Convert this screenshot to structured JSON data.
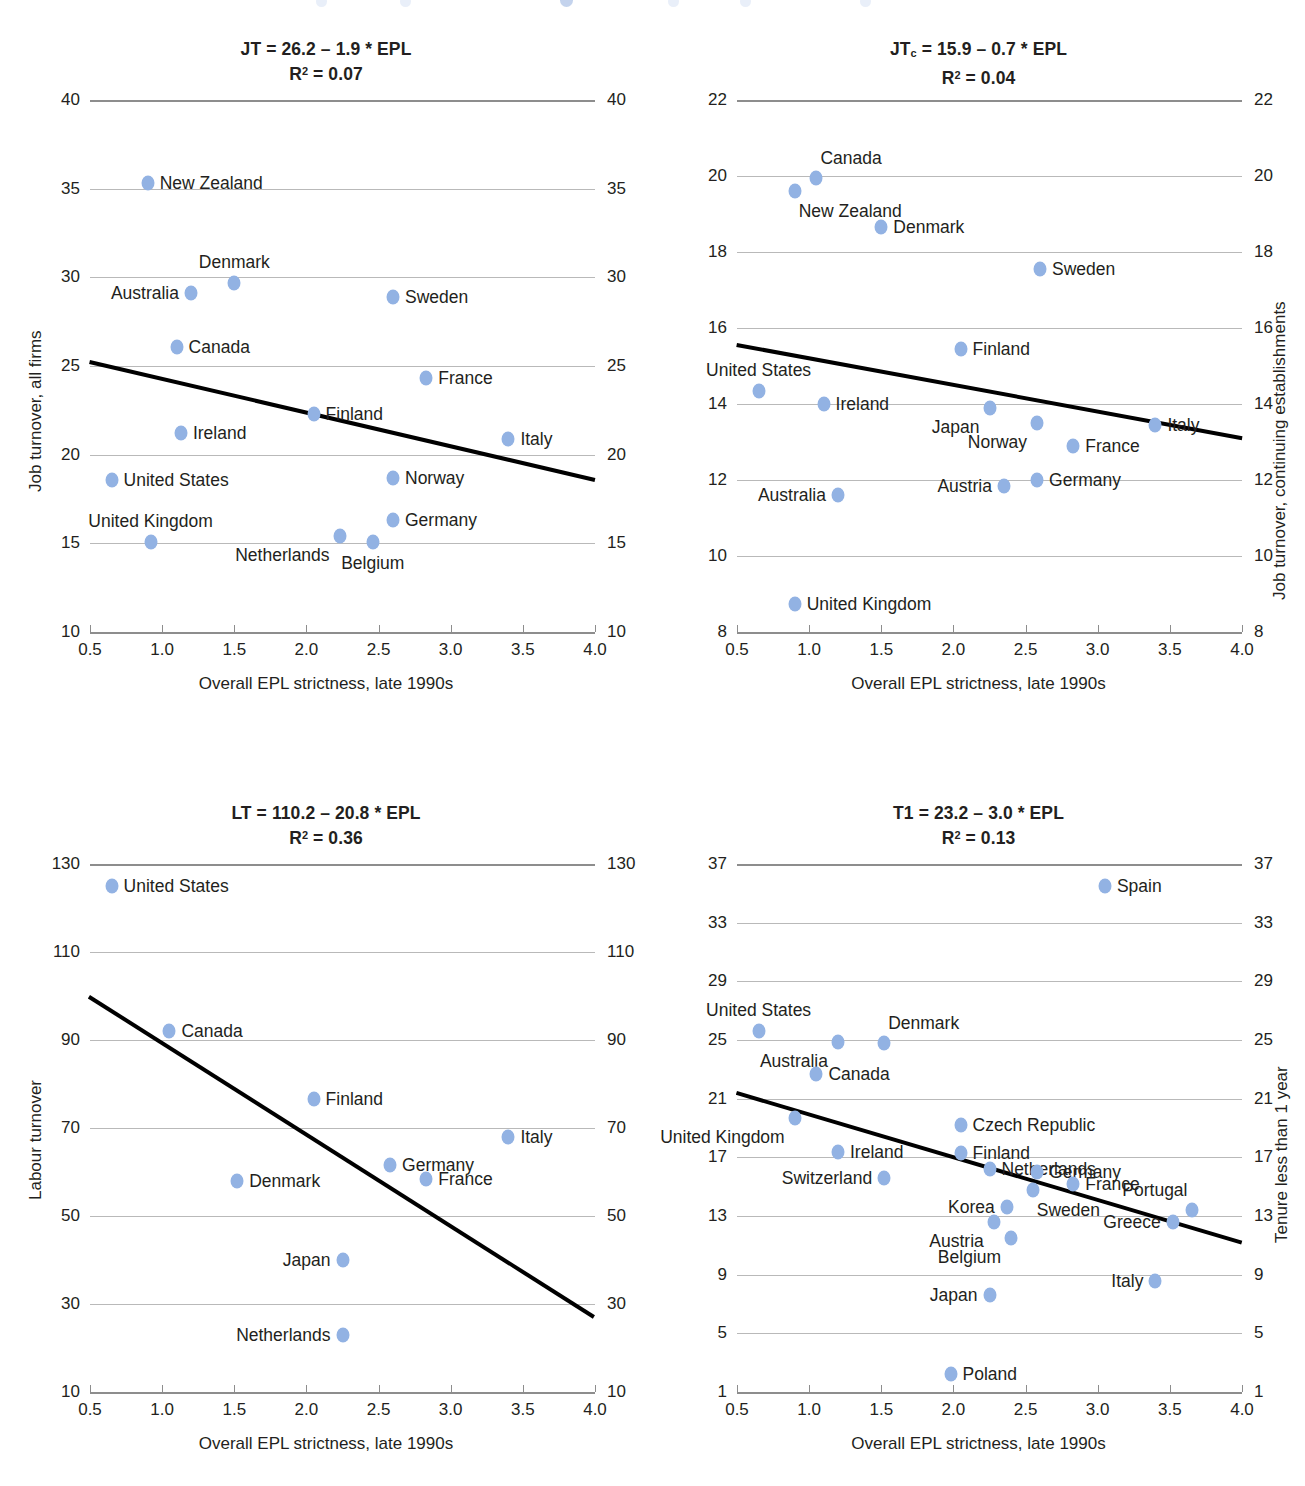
{
  "common": {
    "xlabel": "Overall EPL strictness, late 1990s",
    "xticks": [
      "0.5",
      "1.0",
      "1.5",
      "2.0",
      "2.5",
      "3.0",
      "3.5",
      "4.0"
    ],
    "xlim": [
      0.5,
      4.0
    ],
    "dot_color": "#92b2e3",
    "trend_color": "#000000",
    "grid_color": "#b9b9b9"
  },
  "chart_data": [
    {
      "id": "job-turnover-all-firms",
      "type": "scatter",
      "position": "top-left",
      "title": "JT = 26.2 – 1.9 * EPL",
      "subtitle": "R2 = 0.07",
      "equation": {
        "dep": "JT",
        "intercept": 26.2,
        "slope": -1.9,
        "r2": 0.07
      },
      "ylabel": "Job turnover, all firms",
      "ylabel_right": "",
      "xlabel": "Overall EPL strictness, late 1990s",
      "ylim": [
        10,
        40
      ],
      "yticks": [
        "10",
        "15",
        "20",
        "25",
        "30",
        "35",
        "40"
      ],
      "xlim": [
        0.5,
        4.0
      ],
      "xticks": [
        "0.5",
        "1.0",
        "1.5",
        "2.0",
        "2.5",
        "3.0",
        "3.5",
        "4.0"
      ],
      "grid": true,
      "trendline": {
        "x": [
          0.5,
          4.0
        ],
        "y": [
          25.25,
          18.6
        ]
      },
      "points": [
        {
          "name": "New Zealand",
          "x": 0.9,
          "y": 35.3,
          "label_pos": "right"
        },
        {
          "name": "Denmark",
          "x": 1.5,
          "y": 29.7,
          "label_pos": "above"
        },
        {
          "name": "Australia",
          "x": 1.2,
          "y": 29.1,
          "label_pos": "left"
        },
        {
          "name": "Sweden",
          "x": 2.6,
          "y": 28.9,
          "label_pos": "right"
        },
        {
          "name": "Canada",
          "x": 1.1,
          "y": 26.1,
          "label_pos": "right"
        },
        {
          "name": "France",
          "x": 2.83,
          "y": 24.3,
          "label_pos": "right"
        },
        {
          "name": "Finland",
          "x": 2.05,
          "y": 22.3,
          "label_pos": "right"
        },
        {
          "name": "Ireland",
          "x": 1.13,
          "y": 21.2,
          "label_pos": "right"
        },
        {
          "name": "Italy",
          "x": 3.4,
          "y": 20.9,
          "label_pos": "right"
        },
        {
          "name": "United States",
          "x": 0.65,
          "y": 18.6,
          "label_pos": "right"
        },
        {
          "name": "Norway",
          "x": 2.6,
          "y": 18.7,
          "label_pos": "right"
        },
        {
          "name": "Germany",
          "x": 2.6,
          "y": 16.3,
          "label_pos": "right"
        },
        {
          "name": "United Kingdom",
          "x": 0.92,
          "y": 15.1,
          "label_pos": "above"
        },
        {
          "name": "Netherlands",
          "x": 2.23,
          "y": 15.4,
          "label_pos": "below-left"
        },
        {
          "name": "Belgium",
          "x": 2.46,
          "y": 15.1,
          "label_pos": "below"
        }
      ]
    },
    {
      "id": "job-turnover-continuing-establishments",
      "type": "scatter",
      "position": "top-right",
      "title": "JTc = 15.9 – 0.7 * EPL",
      "subtitle": "R2 = 0.04",
      "equation": {
        "dep": "JTc",
        "intercept": 15.9,
        "slope": -0.7,
        "r2": 0.04
      },
      "ylabel": "",
      "ylabel_right": "Job turnover, continuing establishments",
      "xlabel": "Overall EPL strictness, late 1990s",
      "ylim": [
        8,
        22
      ],
      "yticks": [
        "8",
        "10",
        "12",
        "14",
        "16",
        "18",
        "20",
        "22"
      ],
      "xlim": [
        0.5,
        4.0
      ],
      "xticks": [
        "0.5",
        "1.0",
        "1.5",
        "2.0",
        "2.5",
        "3.0",
        "3.5",
        "4.0"
      ],
      "grid": true,
      "trendline": {
        "x": [
          0.5,
          4.0
        ],
        "y": [
          15.55,
          13.1
        ]
      },
      "points": [
        {
          "name": "Canada",
          "x": 1.05,
          "y": 19.95,
          "label_pos": "above-right"
        },
        {
          "name": "New Zealand",
          "x": 0.9,
          "y": 19.6,
          "label_pos": "below-right"
        },
        {
          "name": "Denmark",
          "x": 1.5,
          "y": 18.65,
          "label_pos": "right"
        },
        {
          "name": "Sweden",
          "x": 2.6,
          "y": 17.55,
          "label_pos": "right"
        },
        {
          "name": "Finland",
          "x": 2.05,
          "y": 15.45,
          "label_pos": "right"
        },
        {
          "name": "United States",
          "x": 0.65,
          "y": 14.35,
          "label_pos": "above"
        },
        {
          "name": "Ireland",
          "x": 1.1,
          "y": 14.0,
          "label_pos": "right"
        },
        {
          "name": "Japan",
          "x": 2.25,
          "y": 13.9,
          "label_pos": "below-left"
        },
        {
          "name": "Norway",
          "x": 2.58,
          "y": 13.5,
          "label_pos": "below-left"
        },
        {
          "name": "Italy",
          "x": 3.4,
          "y": 13.45,
          "label_pos": "right"
        },
        {
          "name": "France",
          "x": 2.83,
          "y": 12.9,
          "label_pos": "right"
        },
        {
          "name": "Germany",
          "x": 2.58,
          "y": 12.0,
          "label_pos": "right"
        },
        {
          "name": "Austria",
          "x": 2.35,
          "y": 11.85,
          "label_pos": "left"
        },
        {
          "name": "Australia",
          "x": 1.2,
          "y": 11.6,
          "label_pos": "left"
        },
        {
          "name": "United Kingdom",
          "x": 0.9,
          "y": 8.75,
          "label_pos": "right"
        }
      ]
    },
    {
      "id": "labour-turnover",
      "type": "scatter",
      "position": "bottom-left",
      "title": "LT = 110.2 – 20.8 * EPL",
      "subtitle": "R2 = 0.36",
      "equation": {
        "dep": "LT",
        "intercept": 110.2,
        "slope": -20.8,
        "r2": 0.36
      },
      "ylabel": "Labour turnover",
      "ylabel_right": "",
      "xlabel": "Overall EPL strictness, late 1990s",
      "ylim": [
        10,
        130
      ],
      "yticks": [
        "10",
        "30",
        "50",
        "70",
        "90",
        "110",
        "130"
      ],
      "xlim": [
        0.5,
        4.0
      ],
      "xticks": [
        "0.5",
        "1.0",
        "1.5",
        "2.0",
        "2.5",
        "3.0",
        "3.5",
        "4.0"
      ],
      "grid": true,
      "trendline": {
        "x": [
          0.5,
          4.0
        ],
        "y": [
          99.8,
          27.0
        ]
      },
      "points": [
        {
          "name": "United States",
          "x": 0.65,
          "y": 125.0,
          "label_pos": "right"
        },
        {
          "name": "Canada",
          "x": 1.05,
          "y": 92.0,
          "label_pos": "right"
        },
        {
          "name": "Finland",
          "x": 2.05,
          "y": 76.5,
          "label_pos": "right"
        },
        {
          "name": "Italy",
          "x": 3.4,
          "y": 68.0,
          "label_pos": "right"
        },
        {
          "name": "Germany",
          "x": 2.58,
          "y": 61.5,
          "label_pos": "right"
        },
        {
          "name": "France",
          "x": 2.83,
          "y": 58.5,
          "label_pos": "right"
        },
        {
          "name": "Denmark",
          "x": 1.52,
          "y": 58.0,
          "label_pos": "right"
        },
        {
          "name": "Japan",
          "x": 2.25,
          "y": 40.0,
          "label_pos": "left"
        },
        {
          "name": "Netherlands",
          "x": 2.25,
          "y": 23.0,
          "label_pos": "left"
        }
      ]
    },
    {
      "id": "tenure-less-than-1-year",
      "type": "scatter",
      "position": "bottom-right",
      "title": "T1 = 23.2 – 3.0 * EPL",
      "subtitle": "R2 = 0.13",
      "equation": {
        "dep": "T1",
        "intercept": 23.2,
        "slope": -3.0,
        "r2": 0.13
      },
      "ylabel": "",
      "ylabel_right": "Tenure less than 1 year",
      "xlabel": "Overall EPL strictness, late 1990s",
      "ylim": [
        1,
        37
      ],
      "yticks": [
        "1",
        "5",
        "9",
        "13",
        "17",
        "21",
        "25",
        "29",
        "33",
        "37"
      ],
      "xlim": [
        0.5,
        4.0
      ],
      "xticks": [
        "0.5",
        "1.0",
        "1.5",
        "2.0",
        "2.5",
        "3.0",
        "3.5",
        "4.0"
      ],
      "grid": true,
      "trendline": {
        "x": [
          0.5,
          4.0
        ],
        "y": [
          21.4,
          11.2
        ]
      },
      "points": [
        {
          "name": "Spain",
          "x": 3.05,
          "y": 35.5,
          "label_pos": "right"
        },
        {
          "name": "United States",
          "x": 0.65,
          "y": 25.6,
          "label_pos": "above"
        },
        {
          "name": "Australia",
          "x": 1.2,
          "y": 24.9,
          "label_pos": "below-left"
        },
        {
          "name": "Denmark",
          "x": 1.52,
          "y": 24.8,
          "label_pos": "above-right"
        },
        {
          "name": "Canada",
          "x": 1.05,
          "y": 22.7,
          "label_pos": "right"
        },
        {
          "name": "United Kingdom",
          "x": 0.9,
          "y": 19.7,
          "label_pos": "below-left"
        },
        {
          "name": "Czech Republic",
          "x": 2.05,
          "y": 19.2,
          "label_pos": "right"
        },
        {
          "name": "Ireland",
          "x": 1.2,
          "y": 17.4,
          "label_pos": "right"
        },
        {
          "name": "Finland",
          "x": 2.05,
          "y": 17.3,
          "label_pos": "right"
        },
        {
          "name": "Netherlands",
          "x": 2.25,
          "y": 16.2,
          "label_pos": "right"
        },
        {
          "name": "Switzerland",
          "x": 1.52,
          "y": 15.6,
          "label_pos": "left"
        },
        {
          "name": "Germany",
          "x": 2.58,
          "y": 16.0,
          "label_pos": "right"
        },
        {
          "name": "France",
          "x": 2.83,
          "y": 15.2,
          "label_pos": "right"
        },
        {
          "name": "Sweden",
          "x": 2.55,
          "y": 14.8,
          "label_pos": "below-right"
        },
        {
          "name": "Korea",
          "x": 2.37,
          "y": 13.6,
          "label_pos": "left"
        },
        {
          "name": "Austria",
          "x": 2.28,
          "y": 12.6,
          "label_pos": "below-left"
        },
        {
          "name": "Belgium",
          "x": 2.4,
          "y": 11.5,
          "label_pos": "below-left"
        },
        {
          "name": "Greece",
          "x": 3.52,
          "y": 12.6,
          "label_pos": "left"
        },
        {
          "name": "Portugal",
          "x": 3.65,
          "y": 13.4,
          "label_pos": "above-left"
        },
        {
          "name": "Italy",
          "x": 3.4,
          "y": 8.6,
          "label_pos": "left"
        },
        {
          "name": "Japan",
          "x": 2.25,
          "y": 7.6,
          "label_pos": "left"
        },
        {
          "name": "Poland",
          "x": 1.98,
          "y": 2.2,
          "label_pos": "right"
        }
      ]
    }
  ]
}
